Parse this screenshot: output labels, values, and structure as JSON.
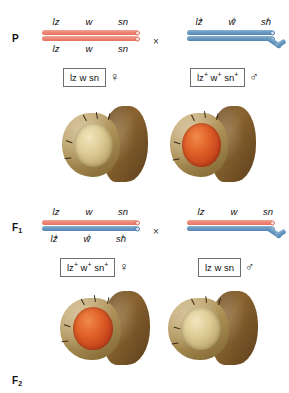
{
  "figure": {
    "organism": "Drosophila",
    "colors": {
      "maternal_chromosome": "#ee8878",
      "paternal_chromosome": "#6b9bc3",
      "box_border": "#6f6f6f",
      "red_eye": "#e2632a",
      "white_eye": "#ddcb95"
    },
    "gene_order": [
      "lz",
      "w",
      "sn"
    ],
    "cross_symbol": "×"
  },
  "generations": [
    {
      "label": "P",
      "label_sub": "",
      "cross_symbol": "×",
      "parents": [
        {
          "side": "left",
          "sex": "female",
          "sex_symbol": "♀",
          "genotype_box": "lz w sn",
          "genotype_box_parts": [
            {
              "gene": "lz",
              "allele": ""
            },
            {
              "gene": "w",
              "allele": ""
            },
            {
              "gene": "sn",
              "allele": ""
            }
          ],
          "top_genes": [
            {
              "text": "lz",
              "sup": ""
            },
            {
              "text": "w",
              "sup": ""
            },
            {
              "text": "sn",
              "sup": ""
            }
          ],
          "bottom_genes": [
            {
              "text": "lz",
              "sup": ""
            },
            {
              "text": "w",
              "sup": ""
            },
            {
              "text": "sn",
              "sup": ""
            }
          ],
          "chromosomes": [
            {
              "type": "X",
              "color": "maternal"
            },
            {
              "type": "X",
              "color": "maternal"
            }
          ],
          "phenotype": "white-eye",
          "phenotype_caption": ""
        },
        {
          "side": "right",
          "sex": "male",
          "sex_symbol": "♂",
          "genotype_box": "lz+ w+ sn+",
          "genotype_box_parts": [
            {
              "gene": "lz",
              "allele": "+"
            },
            {
              "gene": "w",
              "allele": "+"
            },
            {
              "gene": "sn",
              "allele": "+"
            }
          ],
          "top_genes": [
            {
              "text": "lz",
              "sup": "+"
            },
            {
              "text": "w",
              "sup": "+"
            },
            {
              "text": "sn",
              "sup": "+"
            }
          ],
          "bottom_genes": [],
          "chromosomes": [
            {
              "type": "X",
              "color": "paternal"
            },
            {
              "type": "Y",
              "color": "paternal"
            }
          ],
          "phenotype": "red-eye",
          "phenotype_caption": ""
        }
      ]
    },
    {
      "label": "F",
      "label_sub": "1",
      "cross_symbol": "×",
      "parents": [
        {
          "side": "left",
          "sex": "female",
          "sex_symbol": "♀",
          "genotype_box": "lz+ w+ sn+",
          "genotype_box_parts": [
            {
              "gene": "lz",
              "allele": "+"
            },
            {
              "gene": "w",
              "allele": "+"
            },
            {
              "gene": "sn",
              "allele": "+"
            }
          ],
          "top_genes": [
            {
              "text": "lz",
              "sup": ""
            },
            {
              "text": "w",
              "sup": ""
            },
            {
              "text": "sn",
              "sup": ""
            }
          ],
          "bottom_genes": [
            {
              "text": "lz",
              "sup": "+"
            },
            {
              "text": "w",
              "sup": "+"
            },
            {
              "text": "sn",
              "sup": "+"
            }
          ],
          "chromosomes": [
            {
              "type": "X",
              "color": "maternal"
            },
            {
              "type": "X",
              "color": "paternal"
            }
          ],
          "phenotype": "red-eye",
          "phenotype_caption": ""
        },
        {
          "side": "right",
          "sex": "male",
          "sex_symbol": "♂",
          "genotype_box": "lz w sn",
          "genotype_box_parts": [
            {
              "gene": "lz",
              "allele": ""
            },
            {
              "gene": "w",
              "allele": ""
            },
            {
              "gene": "sn",
              "allele": ""
            }
          ],
          "top_genes": [
            {
              "text": "lz",
              "sup": ""
            },
            {
              "text": "w",
              "sup": ""
            },
            {
              "text": "sn",
              "sup": ""
            }
          ],
          "bottom_genes": [],
          "chromosomes": [
            {
              "type": "X",
              "color": "maternal"
            },
            {
              "type": "Y",
              "color": "paternal"
            }
          ],
          "phenotype": "white-eye",
          "phenotype_caption": ""
        }
      ]
    },
    {
      "label": "F",
      "label_sub": "2",
      "cross_symbol": "",
      "parents": []
    }
  ]
}
